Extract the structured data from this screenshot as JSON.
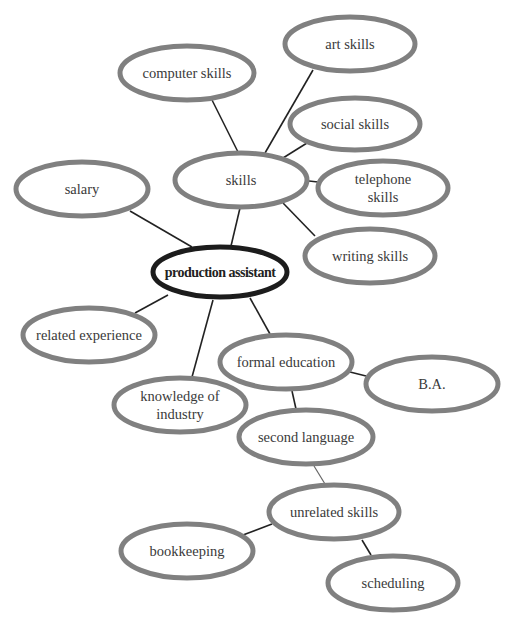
{
  "diagram": {
    "type": "mind-map",
    "title_fragment": "",
    "colors": {
      "node_stroke": "#808080",
      "center_stroke": "#1c1c1c",
      "edge": "#222222",
      "text": "#3a3a3a",
      "background": "#ffffff"
    },
    "center": {
      "id": "production-assistant",
      "label": "production assistant",
      "cx": 220,
      "cy": 272,
      "rx": 67,
      "ry": 25
    },
    "nodes": [
      {
        "id": "skills",
        "lines": [
          "skills"
        ],
        "cx": 241,
        "cy": 180,
        "rx": 66,
        "ry": 27
      },
      {
        "id": "computer-skills",
        "lines": [
          "computer skills"
        ],
        "cx": 187,
        "cy": 73,
        "rx": 67,
        "ry": 27
      },
      {
        "id": "art-skills",
        "lines": [
          "art skills"
        ],
        "cx": 350,
        "cy": 44,
        "rx": 65,
        "ry": 27
      },
      {
        "id": "social-skills",
        "lines": [
          "social skills"
        ],
        "cx": 355,
        "cy": 124,
        "rx": 65,
        "ry": 26
      },
      {
        "id": "telephone-skills",
        "lines": [
          "telephone",
          "skills"
        ],
        "cx": 383,
        "cy": 188,
        "rx": 65,
        "ry": 27
      },
      {
        "id": "writing-skills",
        "lines": [
          "writing skills"
        ],
        "cx": 370,
        "cy": 256,
        "rx": 65,
        "ry": 27
      },
      {
        "id": "salary",
        "lines": [
          "salary"
        ],
        "cx": 82,
        "cy": 189,
        "rx": 66,
        "ry": 27
      },
      {
        "id": "related-experience",
        "lines": [
          "related experience"
        ],
        "cx": 89,
        "cy": 335,
        "rx": 66,
        "ry": 27
      },
      {
        "id": "knowledge-of-industry",
        "lines": [
          "knowledge of",
          "industry"
        ],
        "cx": 180,
        "cy": 405,
        "rx": 66,
        "ry": 27
      },
      {
        "id": "formal-education",
        "lines": [
          "formal education"
        ],
        "cx": 286,
        "cy": 362,
        "rx": 66,
        "ry": 27
      },
      {
        "id": "ba",
        "lines": [
          "B.A."
        ],
        "cx": 432,
        "cy": 384,
        "rx": 66,
        "ry": 27
      },
      {
        "id": "second-language",
        "lines": [
          "second language"
        ],
        "cx": 306,
        "cy": 437,
        "rx": 67,
        "ry": 27
      },
      {
        "id": "unrelated-skills",
        "lines": [
          "unrelated skills"
        ],
        "cx": 334,
        "cy": 512,
        "rx": 65,
        "ry": 27
      },
      {
        "id": "bookkeeping",
        "lines": [
          "bookkeeping"
        ],
        "cx": 187,
        "cy": 551,
        "rx": 66,
        "ry": 27
      },
      {
        "id": "scheduling",
        "lines": [
          "scheduling"
        ],
        "cx": 393,
        "cy": 583,
        "rx": 65,
        "ry": 27
      }
    ],
    "edges": [
      {
        "from": "production-assistant",
        "to": "skills",
        "x1": 231,
        "y1": 246,
        "x2": 240,
        "y2": 208
      },
      {
        "from": "production-assistant",
        "to": "salary",
        "x1": 192,
        "y1": 247,
        "x2": 130,
        "y2": 211
      },
      {
        "from": "production-assistant",
        "to": "related-experience",
        "x1": 168,
        "y1": 295,
        "x2": 135,
        "y2": 313
      },
      {
        "from": "production-assistant",
        "to": "knowledge-of-industry",
        "x1": 213,
        "y1": 300,
        "x2": 192,
        "y2": 377
      },
      {
        "from": "production-assistant",
        "to": "formal-education",
        "x1": 250,
        "y1": 298,
        "x2": 270,
        "y2": 334
      },
      {
        "from": "skills",
        "to": "computer-skills",
        "x1": 238,
        "y1": 152,
        "x2": 212,
        "y2": 100
      },
      {
        "from": "skills",
        "to": "art-skills",
        "x1": 265,
        "y1": 153,
        "x2": 313,
        "y2": 70
      },
      {
        "from": "skills",
        "to": "social-skills",
        "x1": 283,
        "y1": 158,
        "x2": 307,
        "y2": 143
      },
      {
        "from": "skills",
        "to": "telephone-skills",
        "x1": 309,
        "y1": 181,
        "x2": 318,
        "y2": 182
      },
      {
        "from": "skills",
        "to": "writing-skills",
        "x1": 283,
        "y1": 203,
        "x2": 315,
        "y2": 236
      },
      {
        "from": "formal-education",
        "to": "ba",
        "x1": 350,
        "y1": 372,
        "x2": 366,
        "y2": 376
      },
      {
        "from": "formal-education",
        "to": "second-language",
        "x1": 292,
        "y1": 391,
        "x2": 296,
        "y2": 409
      },
      {
        "from": "second-language",
        "to": "unrelated-skills",
        "x1": 314,
        "y1": 466,
        "x2": 325,
        "y2": 484,
        "style": "light"
      },
      {
        "from": "unrelated-skills",
        "to": "bookkeeping",
        "x1": 272,
        "y1": 524,
        "x2": 243,
        "y2": 535
      },
      {
        "from": "unrelated-skills",
        "to": "scheduling",
        "x1": 362,
        "y1": 540,
        "x2": 371,
        "y2": 555
      }
    ]
  }
}
